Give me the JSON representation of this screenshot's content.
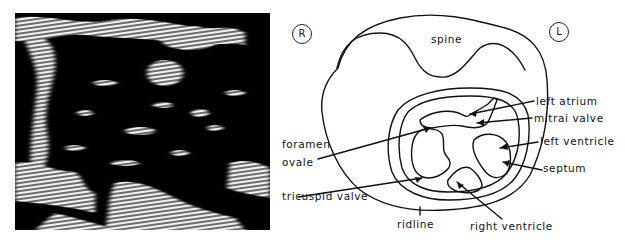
{
  "figure": {
    "left_panel": {
      "type": "ultrasound-image",
      "description": "Black and white echocardiographic scan with horizontal scan-line streaks"
    },
    "right_panel": {
      "type": "labeled-line-drawing",
      "markers": {
        "right": "R",
        "left": "L"
      },
      "labels": {
        "spine": "spine",
        "left_atrium": "left  atrium",
        "mitral_valve": "mitrai valve",
        "left_ventricle": "left ventricle",
        "septum": "septum",
        "foramen_line1": "foramen",
        "foramen_line2": "ovale",
        "tricuspid_valve": "tricuspid valve",
        "midline": "ridline",
        "right_ventricle": "right ventricle"
      }
    },
    "colors": {
      "background": "#ffffff",
      "ink": "#111111",
      "scan_dark": "#000000",
      "scan_light": "#f2f2f2"
    }
  }
}
